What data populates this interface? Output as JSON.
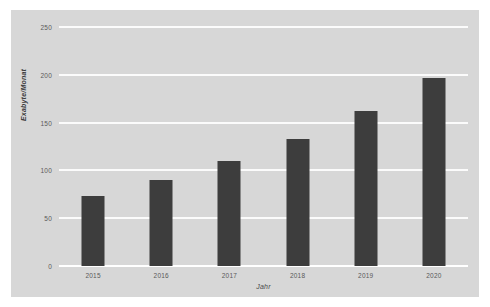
{
  "chart_data": {
    "type": "bar",
    "title": "",
    "subtitle": "",
    "xlabel": "Jahr",
    "ylabel": "Exabyte/Monat",
    "categories": [
      "2015",
      "2016",
      "2017",
      "2018",
      "2019",
      "2020"
    ],
    "values": [
      73,
      90,
      110,
      133,
      162,
      197
    ],
    "series": [
      {
        "name": "Exabyte/Monat",
        "values": [
          73,
          90,
          110,
          133,
          162,
          197
        ]
      }
    ],
    "yticks": [
      0,
      50,
      100,
      150,
      200,
      250
    ],
    "ytick_labels": [
      "0",
      "50",
      "100",
      "150",
      "200",
      "250"
    ],
    "ylim": [
      0,
      250
    ],
    "xlim_categories": 6,
    "grid": true,
    "grid_axis": "y",
    "grid_color": "#fbfbfb",
    "legend": false,
    "legend_position": "none",
    "bar_color": "#3d3d3d",
    "plot_background": "#d7d7d7",
    "page_background": "#ffffff",
    "tick_label_color": "#5a5a5a",
    "axis_title_color": "#3c3c3c",
    "annotations": []
  }
}
